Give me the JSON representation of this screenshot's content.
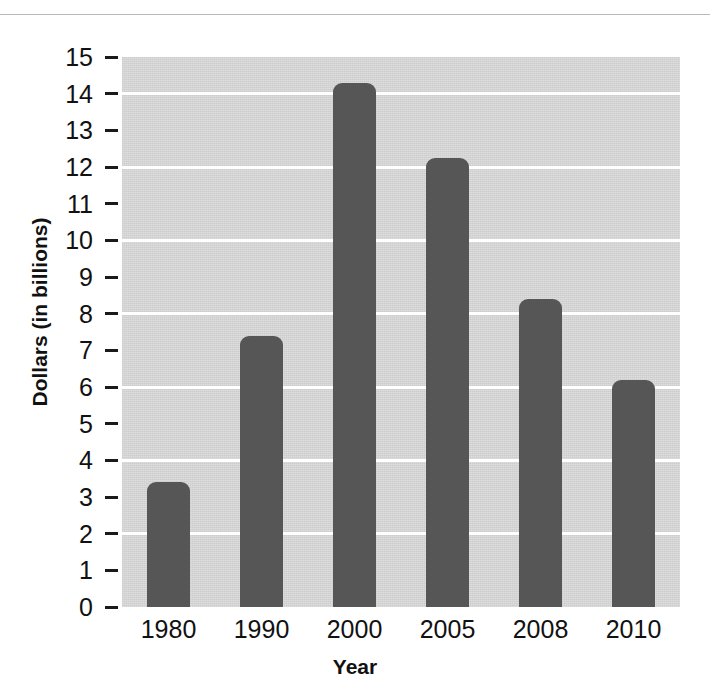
{
  "chart_data": {
    "type": "bar",
    "title": "",
    "xlabel": "Year",
    "ylabel": "Dollars (in billions)",
    "categories": [
      "1980",
      "1990",
      "2000",
      "2005",
      "2008",
      "2010"
    ],
    "values": [
      3.4,
      7.4,
      14.3,
      12.25,
      8.4,
      6.2
    ],
    "ylim": [
      0,
      15
    ],
    "ytick_labels": [
      "15",
      "14",
      "13",
      "12",
      "11",
      "10",
      "9",
      "8",
      "7",
      "6",
      "5",
      "4",
      "3",
      "2",
      "1",
      "0"
    ],
    "ytick_values": [
      15,
      14,
      13,
      12,
      11,
      10,
      9,
      8,
      7,
      6,
      5,
      4,
      3,
      2,
      1,
      0
    ],
    "gridline_values": [
      14,
      12,
      10,
      8,
      6,
      4,
      2
    ],
    "grid": true,
    "legend": false,
    "bar_color": "#565656",
    "plot_background_color": "#d4d4d4",
    "gridline_color": "#ffffff",
    "page_background_color": "#ffffff",
    "axis_text_color": "#111111"
  }
}
